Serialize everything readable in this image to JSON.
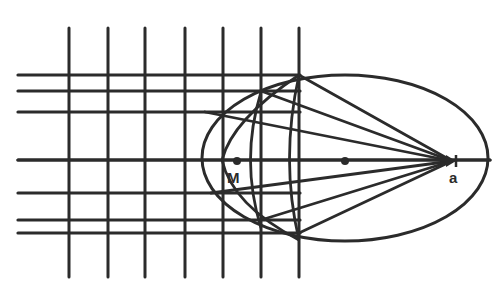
{
  "diagram": {
    "stroke_color": "#2b2b2b",
    "background": "#ffffff",
    "horizontal_lines_y": [
      75,
      91,
      112,
      160,
      193,
      220,
      233
    ],
    "horizontal_line_x_start": 18,
    "vertical_lines_x": [
      69,
      108,
      145,
      185,
      223,
      261,
      299
    ],
    "vertical_line_y_range": [
      28,
      277
    ],
    "ellipse": {
      "cx": 345,
      "cy": 158,
      "rx": 143,
      "ry": 83
    },
    "axis": {
      "x1": 18,
      "x2": 490,
      "y": 160
    },
    "focus": {
      "x": 452,
      "y": 161
    },
    "rays_to_focus": [
      {
        "x": 299,
        "y": 75
      },
      {
        "x": 261,
        "y": 91
      },
      {
        "x": 205,
        "y": 112
      },
      {
        "x": 211,
        "y": 193
      },
      {
        "x": 261,
        "y": 220
      },
      {
        "x": 299,
        "y": 233
      }
    ],
    "inner_arcs": [
      "M 299 75 Q 232 120 222 160 Q 232 205 299 240",
      "M 261 92 Q 240 160 261 228",
      "M 299 75 Q 280 160 299 240"
    ],
    "points": [
      {
        "name": "M",
        "x": 237,
        "y": 161
      },
      {
        "name": "center",
        "x": 345,
        "y": 161
      }
    ],
    "labels": {
      "M": "M",
      "a": "a"
    }
  }
}
